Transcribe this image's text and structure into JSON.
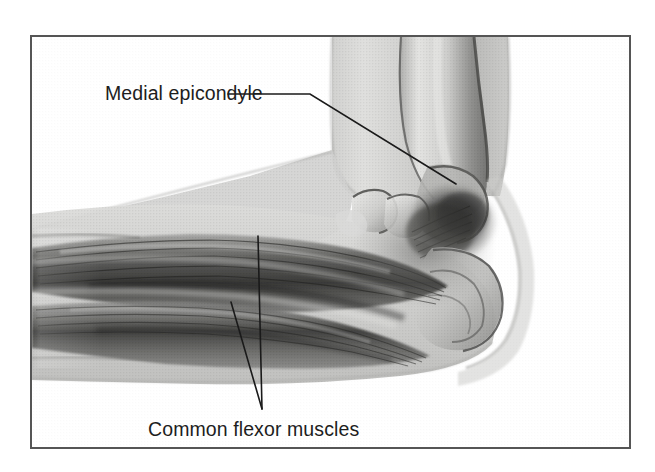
{
  "figure": {
    "kind": "medical-anatomy-illustration",
    "view": "medial",
    "render_style": "grayscale halftone airbrush / semi-transparent x-ray overlay",
    "frame": {
      "border_color": "#555555",
      "border_width_px": 2,
      "x": 31,
      "y": 36,
      "width": 599,
      "height": 412,
      "background": "#ffffff"
    },
    "palette": {
      "page_background": "#ffffff",
      "skin_light": "#d8d8d6",
      "skin_mid": "#c3c3c1",
      "bone_light": "#e9e9e7",
      "bone_shadow": "#8e8e8c",
      "muscle_mid": "#8a8a88",
      "muscle_dark": "#4a4a48",
      "muscle_darkest": "#2b2b2a",
      "outline": "#3a3a38",
      "label_text": "#1d1d1d",
      "leader_line": "#1a1a1a"
    }
  },
  "labels": [
    {
      "id": "medial-epicondyle",
      "text": "Medial epicondyle",
      "text_x": 105,
      "text_y": 100,
      "anchor": "start",
      "leader": {
        "points": "228,94 310,94 456,184",
        "target_structure": "medial epicondyle of the humerus",
        "target_x": 456,
        "target_y": 184
      }
    },
    {
      "id": "common-flexor-muscles",
      "text": "Common flexor muscles",
      "text_x": 148,
      "text_y": 436,
      "anchor": "start",
      "leader": {
        "points_primary": "258,236 262,409",
        "points_secondary": "231,302 262,409",
        "target_structure": "common flexor muscle bellies of the forearm",
        "converge_x": 262,
        "converge_y": 409
      }
    }
  ],
  "anatomy": {
    "structures": [
      {
        "name": "humerus",
        "region": "upper arm, descending from top of frame toward elbow"
      },
      {
        "name": "medial epicondyle",
        "region": "bony prominence at distal medial humerus"
      },
      {
        "name": "olecranon",
        "region": "posterior elbow prominence"
      },
      {
        "name": "ulna",
        "region": "forearm, posterior"
      },
      {
        "name": "radius",
        "region": "forearm, anterior"
      },
      {
        "name": "common flexor tendon",
        "region": "origin at medial epicondyle"
      },
      {
        "name": "common flexor muscles",
        "region": "forearm flexor bellies running to the left"
      },
      {
        "name": "biceps brachii / soft tissue envelope",
        "region": "upper arm anterior"
      },
      {
        "name": "skin silhouette",
        "region": "outer limb contour"
      }
    ]
  }
}
